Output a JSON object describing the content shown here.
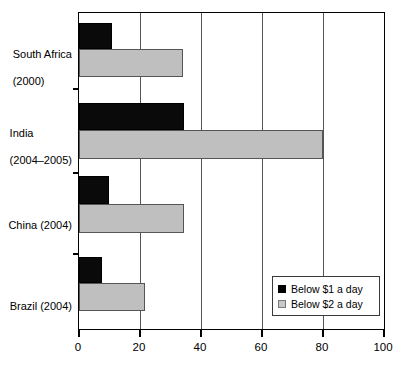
{
  "chart_data": {
    "type": "bar",
    "orientation": "horizontal",
    "title": "",
    "subtitle": "",
    "xlabel": "",
    "ylabel": "",
    "categories": [
      "South Africa (2000)",
      "India (2004–2005)",
      "China (2004)",
      "Brazil (2004)"
    ],
    "category_lines": [
      [
        "South Africa",
        "(2000)"
      ],
      [
        "India",
        "(2004–2005)"
      ],
      [
        "China (2004)"
      ],
      [
        "Brazil (2004)"
      ]
    ],
    "series": [
      {
        "name": "Below $1 a day",
        "color": "#000000",
        "values": [
          10.7,
          34.3,
          9.9,
          7.5
        ]
      },
      {
        "name": "Below $2 a day",
        "color": "#c0c0c0",
        "values": [
          34.2,
          80.0,
          34.5,
          21.5
        ]
      }
    ],
    "xlim": [
      0,
      100
    ],
    "xticks": [
      0,
      20,
      40,
      60,
      80,
      100
    ],
    "xticklabels": [
      "0",
      "20",
      "40",
      "60",
      "80",
      "100"
    ],
    "grid": "vertical",
    "legend_position": "bottom-right-inside"
  },
  "legend": {
    "entries": [
      {
        "label": "Below $1 a day",
        "swatch": "black-square"
      },
      {
        "label": "Below $2 a day",
        "swatch": "gray-square"
      }
    ]
  },
  "axis": {
    "x_tick_labels": [
      "0",
      "20",
      "40",
      "60",
      "80",
      "100"
    ],
    "y_category_labels": [
      {
        "line1": "South Africa",
        "line2": "(2000)"
      },
      {
        "line1": "India",
        "line2": "(2004–2005)"
      },
      {
        "line1": "China (2004)",
        "line2": ""
      },
      {
        "line1": "Brazil (2004)",
        "line2": ""
      }
    ]
  },
  "colors": {
    "series1": "#000000",
    "series2": "#c0c0c0",
    "axis": "#000000",
    "grid": "#555555",
    "background": "#ffffff"
  }
}
